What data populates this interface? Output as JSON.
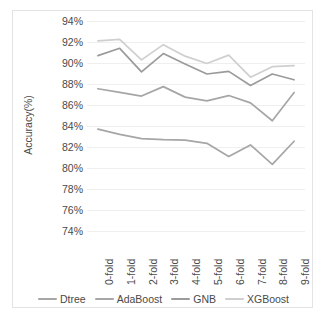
{
  "chart_data": {
    "type": "line",
    "title": "",
    "xlabel": "",
    "ylabel": "Accuracy(%)",
    "categories": [
      "0-fold",
      "1-fold",
      "2-fold",
      "3-fold",
      "4-fold",
      "5-fold",
      "6-fold",
      "7-fold",
      "8-fold",
      "9-fold"
    ],
    "ylim": [
      74,
      94
    ],
    "ytick_labels": [
      "94%",
      "92%",
      "90%",
      "88%",
      "86%",
      "84%",
      "82%",
      "80%",
      "78%",
      "76%",
      "74%"
    ],
    "ytick_values": [
      94,
      92,
      90,
      88,
      86,
      84,
      82,
      80,
      78,
      76,
      74
    ],
    "ytick_step": 2,
    "grid": true,
    "legend_position": "bottom",
    "value_suffix": "%",
    "series": [
      {
        "name": "Dtree",
        "color": "#a6a6a6",
        "values": [
          83.7,
          83.2,
          82.8,
          82.7,
          82.65,
          82.35,
          81.1,
          82.2,
          80.35,
          82.55
        ]
      },
      {
        "name": "AdaBoost",
        "color": "#a6a6a6",
        "values": [
          87.55,
          87.2,
          86.85,
          87.75,
          86.75,
          86.4,
          86.9,
          86.2,
          84.5,
          87.2
        ]
      },
      {
        "name": "GNB",
        "color": "#9b9b9b",
        "values": [
          90.7,
          91.4,
          89.15,
          90.9,
          89.9,
          88.95,
          89.2,
          87.85,
          88.95,
          88.4
        ]
      },
      {
        "name": "XGBoost",
        "color": "#cfcfcf",
        "values": [
          92.1,
          92.25,
          90.3,
          91.75,
          90.65,
          89.95,
          90.75,
          88.65,
          89.65,
          89.75
        ]
      }
    ]
  },
  "legend": {
    "items": [
      {
        "label": "Dtree"
      },
      {
        "label": "AdaBoost"
      },
      {
        "label": "GNB"
      },
      {
        "label": "XGBoost"
      }
    ]
  }
}
